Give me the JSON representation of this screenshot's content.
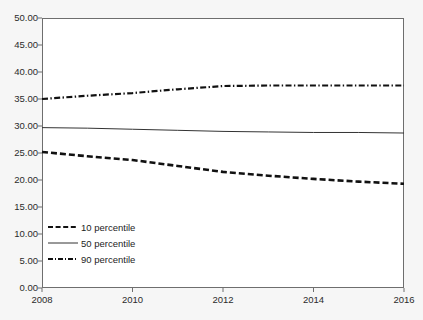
{
  "chart_data": {
    "type": "line",
    "title": "",
    "xlabel": "",
    "ylabel": "",
    "xlim": [
      2008,
      2016
    ],
    "ylim": [
      0,
      50
    ],
    "grid": false,
    "legend_position": "lower-left-inside",
    "x": [
      2008,
      2009,
      2010,
      2011,
      2012,
      2013,
      2014,
      2015,
      2016
    ],
    "xticks": [
      "2008",
      "2010",
      "2012",
      "2014",
      "2016"
    ],
    "xtick_values": [
      2008,
      2010,
      2012,
      2014,
      2016
    ],
    "yticks": [
      "0.00",
      "5.00",
      "10.00",
      "15.00",
      "20.00",
      "25.00",
      "30.00",
      "35.00",
      "40.00",
      "45.00",
      "50.00"
    ],
    "ytick_values": [
      0,
      5,
      10,
      15,
      20,
      25,
      30,
      35,
      40,
      45,
      50
    ],
    "series": [
      {
        "name": "10 percentile",
        "style": "dashed",
        "color": "#111111",
        "values": [
          25.2,
          24.4,
          23.7,
          22.6,
          21.5,
          20.8,
          20.2,
          19.7,
          19.3
        ]
      },
      {
        "name": "50 percentile",
        "style": "solid",
        "color": "#333333",
        "values": [
          29.7,
          29.6,
          29.4,
          29.2,
          29.0,
          28.9,
          28.8,
          28.8,
          28.7
        ]
      },
      {
        "name": "90 percentile",
        "style": "dash-dot",
        "color": "#111111",
        "values": [
          35.0,
          35.6,
          36.1,
          36.8,
          37.4,
          37.5,
          37.5,
          37.5,
          37.5
        ]
      }
    ]
  },
  "legend": {
    "items": [
      {
        "label": "10 percentile"
      },
      {
        "label": "50 percentile"
      },
      {
        "label": "90 percentile"
      }
    ]
  },
  "axes": {
    "y_labels": [
      "50.00",
      "45.00",
      "40.00",
      "35.00",
      "30.00",
      "25.00",
      "20.00",
      "15.00",
      "10.00",
      "5.00",
      "0.00"
    ],
    "x_labels": [
      "2008",
      "2010",
      "2012",
      "2014",
      "2016"
    ]
  }
}
